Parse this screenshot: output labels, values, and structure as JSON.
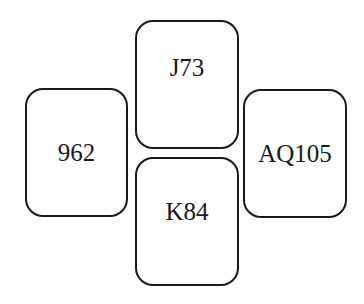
{
  "cards": [
    {
      "id": "left",
      "label": "962"
    },
    {
      "id": "top",
      "label": "J73"
    },
    {
      "id": "bottom",
      "label": "K84"
    },
    {
      "id": "right",
      "label": "AQ105"
    }
  ],
  "colors": {
    "border": "#1a1a1a",
    "text": "#1a1a1a",
    "background": "#ffffff"
  }
}
